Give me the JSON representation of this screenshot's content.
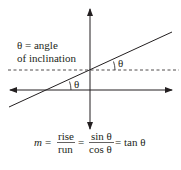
{
  "diagram": {
    "definition_line1": "θ = angle",
    "definition_line2": "of inclination",
    "angle_label_upper": "θ",
    "angle_label_lower": "θ",
    "formula": {
      "m": "m",
      "eq1": "=",
      "rise": "rise",
      "run": "run",
      "eq2": "=",
      "sin": "sin θ",
      "cos": "cos θ",
      "tail": "= tan θ"
    },
    "colors": {
      "stroke": "#231f20"
    }
  }
}
